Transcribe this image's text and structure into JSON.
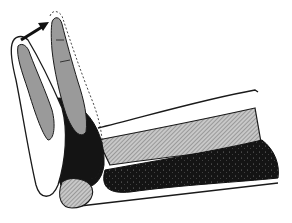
{
  "figure": {
    "caption": "",
    "colors": {
      "background": "#ffffff",
      "outline": "#1a1a1a",
      "bone_gray": "#9a9a9a",
      "hatch_gray": "#a8a8a8",
      "dark_muscle": "#141414",
      "arrow": "#111111"
    },
    "elements": [
      {
        "name": "arrow",
        "description": "motion arrow from toe position A to toe position B"
      },
      {
        "name": "foot-position-a",
        "description": "foot outline before motion (left)"
      },
      {
        "name": "foot-position-b",
        "description": "foot outline after motion (dashed ghost, right)"
      },
      {
        "name": "leg",
        "description": "lower leg extending to the right"
      },
      {
        "name": "calf-muscle",
        "description": "dark stippled muscle mass along lower leg"
      }
    ]
  }
}
